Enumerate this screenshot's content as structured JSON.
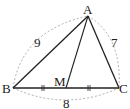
{
  "diagram": {
    "type": "triangle",
    "points": {
      "A": {
        "label": "A",
        "x": 88,
        "y": 16
      },
      "B": {
        "label": "B",
        "x": 13,
        "y": 88
      },
      "C": {
        "label": "C",
        "x": 119,
        "y": 88
      },
      "M": {
        "label": "M",
        "x": 66,
        "y": 88
      }
    },
    "sides": {
      "AB": {
        "length_label": "9"
      },
      "AC": {
        "length_label": "7"
      },
      "BC": {
        "length_label": "8"
      }
    },
    "segments": [
      "AB",
      "AC",
      "BC",
      "AM"
    ],
    "equal_marks": [
      "BM",
      "MC"
    ],
    "colors": {
      "line": "#222222",
      "arc": "#888888",
      "background": "#ffffff"
    }
  }
}
